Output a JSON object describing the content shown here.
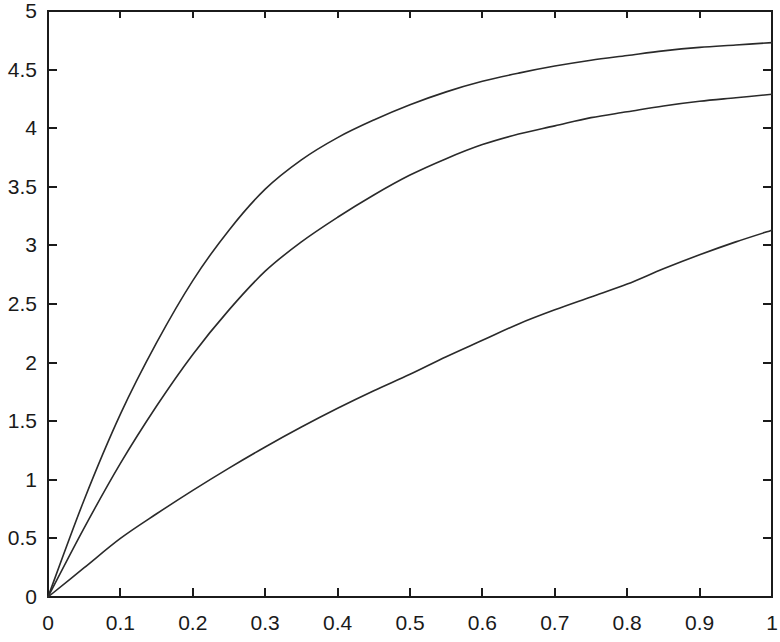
{
  "chart_data": {
    "type": "line",
    "title": "",
    "subtitle": "",
    "xlabel": "",
    "ylabel": "",
    "xlim": [
      0,
      1
    ],
    "ylim": [
      0,
      5
    ],
    "grid": false,
    "legend": null,
    "background_color": "#ffffff",
    "axis_color": "#1b1b1b",
    "line_color": "#2a2a2a",
    "xticks": [
      0,
      0.1,
      0.2,
      0.3,
      0.4,
      0.5,
      0.6,
      0.7,
      0.8,
      0.9,
      1
    ],
    "xtick_labels": [
      "0",
      "0.1",
      "0.2",
      "0.3",
      "0.4",
      "0.5",
      "0.6",
      "0.7",
      "0.8",
      "0.9",
      "1"
    ],
    "yticks": [
      0,
      0.5,
      1,
      1.5,
      2,
      2.5,
      3,
      3.5,
      4,
      4.5,
      5
    ],
    "ytick_labels": [
      "0",
      "0.5",
      "1",
      "1.5",
      "2",
      "2.5",
      "3",
      "3.5",
      "4",
      "4.5",
      "5"
    ],
    "x": [
      0,
      0.05,
      0.1,
      0.15,
      0.2,
      0.25,
      0.3,
      0.35,
      0.4,
      0.45,
      0.5,
      0.55,
      0.6,
      0.65,
      0.7,
      0.75,
      0.8,
      0.85,
      0.9,
      0.95,
      1
    ],
    "series": [
      {
        "name": "curve-upper",
        "values": [
          0,
          0.83,
          1.56,
          2.17,
          2.7,
          3.13,
          3.48,
          3.73,
          3.92,
          4.07,
          4.2,
          4.31,
          4.4,
          4.47,
          4.53,
          4.58,
          4.62,
          4.66,
          4.69,
          4.71,
          4.73
        ]
      },
      {
        "name": "curve-middle",
        "values": [
          0,
          0.59,
          1.14,
          1.63,
          2.07,
          2.45,
          2.78,
          3.03,
          3.24,
          3.43,
          3.6,
          3.74,
          3.86,
          3.95,
          4.02,
          4.09,
          4.14,
          4.19,
          4.23,
          4.26,
          4.29
        ]
      },
      {
        "name": "curve-lower",
        "values": [
          0,
          0.25,
          0.5,
          0.71,
          0.91,
          1.1,
          1.28,
          1.45,
          1.61,
          1.76,
          1.9,
          2.05,
          2.19,
          2.33,
          2.45,
          2.56,
          2.67,
          2.8,
          2.92,
          3.03,
          3.13
        ]
      }
    ]
  }
}
